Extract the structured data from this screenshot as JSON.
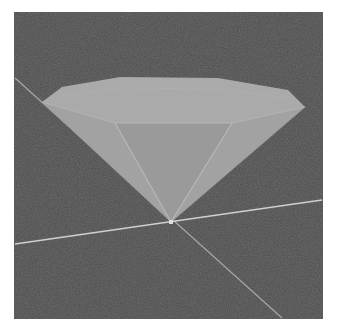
{
  "scene": {
    "description": "3D viewport showing a faceted inverted cone (diamond-like) resting on its apex at the origin of two axis lines",
    "background_color": "#4b4b4b",
    "axis_color": "#c8c8c8",
    "object": {
      "type": "inverted-cone",
      "top_face_color": "#a9a9a9",
      "side_face_color": "#a0a0a0",
      "inner_face_color": "#999999",
      "edge_color": "#b8b8b8"
    },
    "axes": [
      {
        "name": "axis-horizontal",
        "from": [
          1,
          232
        ],
        "to": [
          308,
          188
        ]
      },
      {
        "name": "axis-diagonal",
        "from": [
          1,
          66
        ],
        "to": [
          268,
          306
        ]
      }
    ],
    "apex": [
      157,
      210
    ]
  }
}
